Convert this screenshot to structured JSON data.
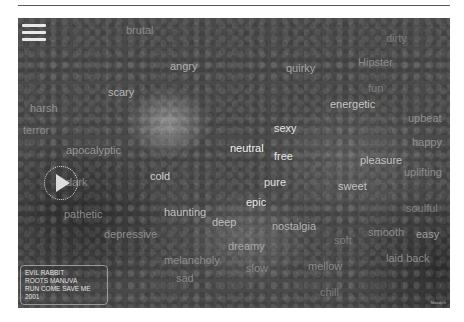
{
  "menu": {
    "icon": "hamburger-menu-icon"
  },
  "player": {
    "icon": "play-icon"
  },
  "now_playing": {
    "title": "EVIL RABBIT",
    "artist": "ROOTS MANUVA",
    "album": "RUN COME SAVE ME",
    "year": "2001"
  },
  "credit": "Moody.fr",
  "words": [
    {
      "text": "brutal",
      "x": 108,
      "y": 6,
      "c": "#8a8a8a"
    },
    {
      "text": "angry",
      "x": 152,
      "y": 42,
      "c": "#b0b0b0"
    },
    {
      "text": "quirky",
      "x": 268,
      "y": 44,
      "c": "#a8a8a8"
    },
    {
      "text": "dirty",
      "x": 368,
      "y": 14,
      "c": "#7a7a7a"
    },
    {
      "text": "Hipster",
      "x": 340,
      "y": 38,
      "c": "#8c8c8c"
    },
    {
      "text": "fun",
      "x": 350,
      "y": 64,
      "c": "#7e7e7e"
    },
    {
      "text": "energetic",
      "x": 312,
      "y": 80,
      "c": "#c8c8c8"
    },
    {
      "text": "scary",
      "x": 90,
      "y": 68,
      "c": "#b8b8b8"
    },
    {
      "text": "harsh",
      "x": 12,
      "y": 84,
      "c": "#909090"
    },
    {
      "text": "terror",
      "x": 5,
      "y": 106,
      "c": "#8a8a8a"
    },
    {
      "text": "upbeat",
      "x": 390,
      "y": 94,
      "c": "#8e8e8e"
    },
    {
      "text": "sexy",
      "x": 256,
      "y": 104,
      "c": "#e4e4e4"
    },
    {
      "text": "happy",
      "x": 394,
      "y": 118,
      "c": "#909090"
    },
    {
      "text": "apocalyptic",
      "x": 48,
      "y": 126,
      "c": "#9a9a9a"
    },
    {
      "text": "neutral",
      "x": 212,
      "y": 124,
      "c": "#f4f4f4"
    },
    {
      "text": "free",
      "x": 256,
      "y": 132,
      "c": "#e6e6e6"
    },
    {
      "text": "pleasure",
      "x": 342,
      "y": 136,
      "c": "#c4c4c4"
    },
    {
      "text": "uplifting",
      "x": 386,
      "y": 148,
      "c": "#8c8c8c"
    },
    {
      "text": "dark",
      "x": 48,
      "y": 158,
      "c": "#8a8a8a"
    },
    {
      "text": "cold",
      "x": 132,
      "y": 152,
      "c": "#d0d0d0"
    },
    {
      "text": "pure",
      "x": 246,
      "y": 158,
      "c": "#e0e0e0"
    },
    {
      "text": "sweet",
      "x": 320,
      "y": 162,
      "c": "#c4c4c4"
    },
    {
      "text": "epic",
      "x": 228,
      "y": 178,
      "c": "#e8e8e8"
    },
    {
      "text": "soulful",
      "x": 388,
      "y": 184,
      "c": "#808080"
    },
    {
      "text": "pathetic",
      "x": 46,
      "y": 190,
      "c": "#8e8e8e"
    },
    {
      "text": "haunting",
      "x": 146,
      "y": 188,
      "c": "#c4c4c4"
    },
    {
      "text": "deep",
      "x": 194,
      "y": 198,
      "c": "#c0c0c0"
    },
    {
      "text": "nostalgia",
      "x": 254,
      "y": 202,
      "c": "#b4b4b4"
    },
    {
      "text": "smooth",
      "x": 350,
      "y": 208,
      "c": "#8c8c8c"
    },
    {
      "text": "easy",
      "x": 398,
      "y": 210,
      "c": "#a0a0a0"
    },
    {
      "text": "depressive",
      "x": 86,
      "y": 210,
      "c": "#8e8e8e"
    },
    {
      "text": "soft",
      "x": 316,
      "y": 216,
      "c": "#808080"
    },
    {
      "text": "dreamy",
      "x": 210,
      "y": 222,
      "c": "#a8a8a8"
    },
    {
      "text": "laid back",
      "x": 368,
      "y": 234,
      "c": "#8c8c8c"
    },
    {
      "text": "melancholy",
      "x": 146,
      "y": 236,
      "c": "#8c8c8c"
    },
    {
      "text": "slow",
      "x": 228,
      "y": 244,
      "c": "#8a8a8a"
    },
    {
      "text": "mellow",
      "x": 290,
      "y": 242,
      "c": "#8c8c8c"
    },
    {
      "text": "sad",
      "x": 158,
      "y": 254,
      "c": "#8a8a8a"
    },
    {
      "text": "chill",
      "x": 302,
      "y": 268,
      "c": "#7c7c7c"
    }
  ]
}
